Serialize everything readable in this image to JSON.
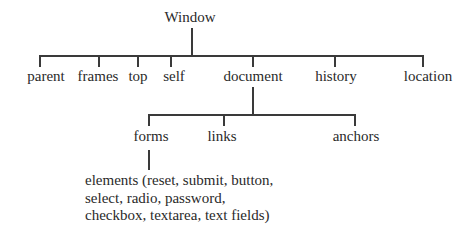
{
  "diagram": {
    "type": "tree",
    "root": {
      "label": "Window"
    },
    "level1": [
      {
        "label": "parent"
      },
      {
        "label": "frames"
      },
      {
        "label": "top"
      },
      {
        "label": "self"
      },
      {
        "label": "document"
      },
      {
        "label": "history"
      },
      {
        "label": "location"
      }
    ],
    "document_children": [
      {
        "label": "forms"
      },
      {
        "label": "links"
      },
      {
        "label": "anchors"
      }
    ],
    "forms_children": {
      "lines": [
        "elements (reset, submit, button,",
        "select, radio, password,",
        "checkbox, textarea, text fields)"
      ]
    },
    "line_color": "#3a3a3a",
    "text_color": "#2a2a2a"
  }
}
